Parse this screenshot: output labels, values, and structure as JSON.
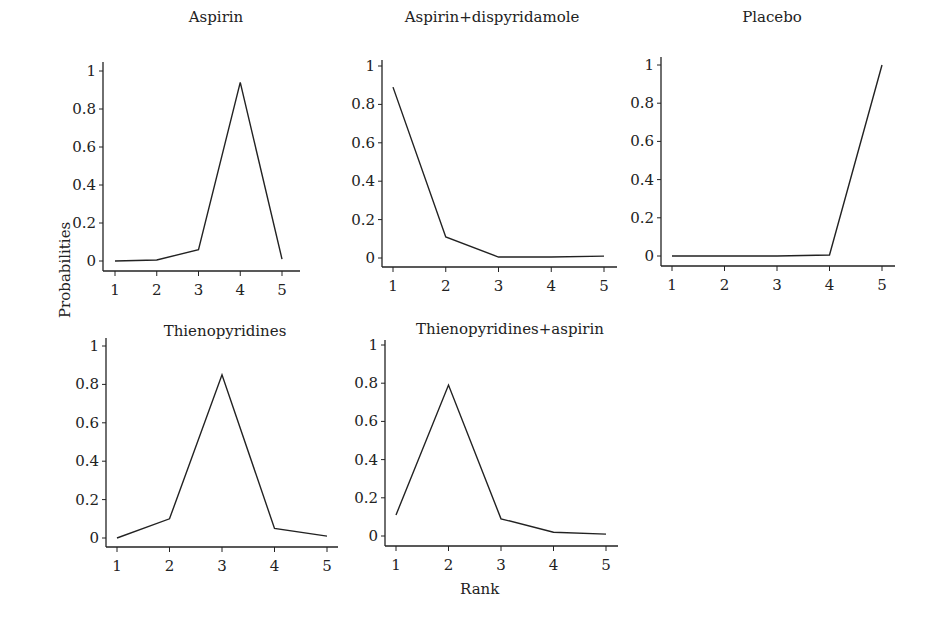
{
  "figure": {
    "ylabel": "Probabilities",
    "xlabel": "Rank"
  },
  "panels_meta": {
    "yticks": [
      "0",
      "0.2",
      "0.4",
      "0.6",
      "0.8",
      "1"
    ],
    "xticks": [
      "1",
      "2",
      "3",
      "4",
      "5"
    ]
  },
  "chart_data": {
    "type": "line",
    "title": "",
    "xlabel": "Rank",
    "ylabel": "Probabilities",
    "ylim": [
      0,
      1
    ],
    "x": [
      1,
      2,
      3,
      4,
      5
    ],
    "grid": false,
    "legend": "none",
    "layout": "small multiples, 2 rows x 3 columns (5 panels)",
    "series": [
      {
        "name": "Aspirin",
        "values": [
          0.0,
          0.005,
          0.06,
          0.94,
          0.01
        ]
      },
      {
        "name": "Aspirin+dispyridamole",
        "values": [
          0.89,
          0.11,
          0.005,
          0.005,
          0.01
        ]
      },
      {
        "name": "Placebo",
        "values": [
          0.0,
          0.0,
          0.0,
          0.005,
          1.0
        ]
      },
      {
        "name": "Thienopyridines",
        "values": [
          0.0,
          0.1,
          0.85,
          0.05,
          0.01
        ]
      },
      {
        "name": "Thienopyridines+aspirin",
        "values": [
          0.11,
          0.79,
          0.09,
          0.02,
          0.01
        ]
      }
    ]
  }
}
